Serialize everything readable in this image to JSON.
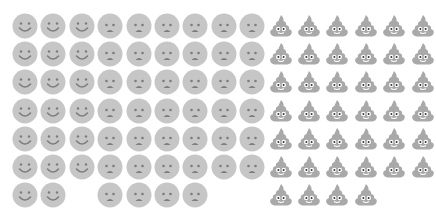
{
  "chart_data": {
    "type": "pictogram",
    "title": "",
    "layout": {
      "rows": 7,
      "columns_per_group": [
        3,
        6,
        6
      ],
      "fill_order": "column-major within group, top to bottom",
      "grid": false,
      "legend": "none"
    },
    "categories": [
      "Happy",
      "Sad",
      "Poop"
    ],
    "values": [
      20,
      40,
      40
    ],
    "series": [
      {
        "name": "Happy",
        "icon": "smiling-face-icon",
        "count": 20,
        "columns": 3,
        "last_row_count": 2
      },
      {
        "name": "Sad",
        "icon": "frowning-face-icon",
        "count": 40,
        "columns": 6,
        "last_row_count": 4
      },
      {
        "name": "Poop",
        "icon": "pile-of-poo-icon",
        "count": 40,
        "columns": 6,
        "last_row_count": 4
      }
    ],
    "colors": {
      "face_fill": "#c6c6c6",
      "face_features": "#7c7c7c",
      "poop_fill": "#a9a9a9",
      "poop_eyes": "#ffffff",
      "background": "#ffffff"
    }
  }
}
